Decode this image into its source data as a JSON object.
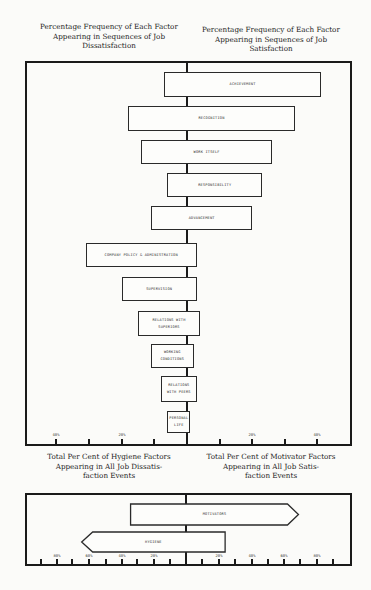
{
  "top_chart": {
    "left_title": [
      "Percentage Frequency of Each Factor",
      "Appearing in Sequences of Job",
      "Dissatisfaction"
    ],
    "right_title": [
      "Percentage Frequency of Each Factor",
      "Appearing in Sequences of Job",
      "Satisfaction"
    ],
    "axis_ticks": [
      "40%",
      "20%",
      "20%",
      "40%"
    ]
  },
  "bottom_chart": {
    "left_title": [
      "Total Per Cent of Hygiene Factors",
      "Appearing in All Job Dissatis-",
      "faction Events"
    ],
    "right_title": [
      "Total Per Cent of Motivator Factors",
      "Appearing in All Job Satis-",
      "faction Events"
    ],
    "axis_ticks": [
      "80%",
      "60%",
      "40%",
      "20%",
      "20%",
      "40%",
      "60%",
      "80%"
    ]
  },
  "chart_data": [
    {
      "type": "bar",
      "orientation": "horizontal-diverging",
      "title": "Percentage Frequency of Each Factor Appearing in Sequences of Job Dissatisfaction / Satisfaction",
      "xlabel_left": "Percentage Frequency of Each Factor Appearing in Sequences of Job Dissatisfaction",
      "xlabel_right": "Percentage Frequency of Each Factor Appearing in Sequences of Job Satisfaction",
      "xlim": [
        -50,
        50
      ],
      "tick_labels": [
        "40%",
        "20%",
        "20%",
        "40%"
      ],
      "grid": false,
      "categories": [
        "ACHIEVEMENT",
        "RECOGNITION",
        "WORK ITSELF",
        "RESPONSIBILITY",
        "ADVANCEMENT",
        "COMPANY POLICY & ADMINISTRATION",
        "SUPERVISION",
        "RELATIONS WITH SUPERIORS",
        "WORKING CONDITIONS",
        "RELATIONS WITH PEERS",
        "PERSONAL LIFE"
      ],
      "series": [
        {
          "name": "Dissatisfaction",
          "values": [
            7,
            18,
            14,
            6,
            11,
            31,
            20,
            15,
            11,
            8,
            6
          ]
        },
        {
          "name": "Satisfaction",
          "values": [
            41,
            33,
            26,
            23,
            20,
            3,
            3,
            4,
            2,
            3,
            1
          ]
        }
      ]
    },
    {
      "type": "bar",
      "orientation": "horizontal-diverging",
      "title": "Total Per Cent of Hygiene / Motivator Factors Appearing in All Job Dissatisfaction / Satisfaction Events",
      "xlabel_left": "Total Per Cent of Hygiene Factors Appearing in All Job Dissatisfaction Events",
      "xlabel_right": "Total Per Cent of Motivator Factors Appearing in All Job Satisfaction Events",
      "xlim": [
        -90,
        90
      ],
      "tick_labels": [
        "80%",
        "60%",
        "40%",
        "20%",
        "20%",
        "40%",
        "60%",
        "80%"
      ],
      "grid": false,
      "categories": [
        "MOTIVATORS",
        "HYGIENE"
      ],
      "series": [
        {
          "name": "Dissatisfaction",
          "values": [
            34,
            64
          ]
        },
        {
          "name": "Satisfaction",
          "values": [
            69,
            24
          ]
        }
      ]
    }
  ]
}
